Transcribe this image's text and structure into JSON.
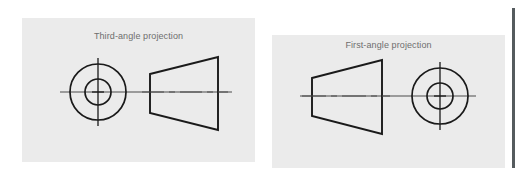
{
  "figure": {
    "background_color": "#ffffff",
    "panel_color": "#ebebeb",
    "line_color": "#1a1a1a",
    "centerline_color": "#4d4d4d",
    "caption_color": "#6e6e6e",
    "edge_rule_color": "#555b5e"
  },
  "panels": [
    {
      "id": "third-angle",
      "caption": "Third-angle projection",
      "views": [
        {
          "name": "end-view-circles",
          "shape": "concentric-circles",
          "center": [
            76,
            74
          ],
          "outer_radius": 28,
          "inner_radius": 13,
          "centerlines": [
            "horizontal",
            "vertical"
          ]
        },
        {
          "name": "side-view-cone",
          "shape": "trapezoid",
          "orientation": "narrow-left-wide-right",
          "left_edge_x": 128,
          "left_edge_top_y": 56,
          "left_edge_bottom_y": 95,
          "right_edge_x": 196,
          "right_edge_top_y": 39,
          "right_edge_bottom_y": 112,
          "centerline": "dash-dot-horizontal"
        }
      ],
      "view_order": "circles-left, cone-right"
    },
    {
      "id": "first-angle",
      "caption": "First-angle projection",
      "views": [
        {
          "name": "side-view-cone",
          "shape": "trapezoid",
          "orientation": "narrow-left-wide-right",
          "left_edge_x": 40,
          "left_edge_top_y": 43,
          "left_edge_bottom_y": 81,
          "right_edge_x": 110,
          "right_edge_top_y": 25,
          "right_edge_bottom_y": 99,
          "centerline": "dash-dot-horizontal"
        },
        {
          "name": "end-view-circles",
          "shape": "concentric-circles",
          "center": [
            168,
            61
          ],
          "outer_radius": 28,
          "inner_radius": 13,
          "centerlines": [
            "horizontal",
            "vertical"
          ]
        }
      ],
      "view_order": "cone-left, circles-right"
    }
  ]
}
